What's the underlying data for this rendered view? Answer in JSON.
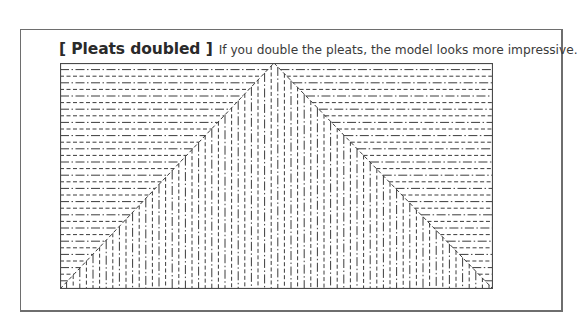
{
  "caption": {
    "title": "[ Pleats doubled ]",
    "text": "If you double the pleats, the model looks more impressive."
  },
  "diagram": {
    "width": 433,
    "height": 226,
    "apex_x": 214,
    "line_spacing": 6.6,
    "line_styles": {
      "mountain": "dash-dot",
      "valley": "dashed"
    },
    "colors": {
      "stroke": "#3c3c3c",
      "border": "#4a4a4a",
      "frame": "#6e6e6e"
    }
  }
}
